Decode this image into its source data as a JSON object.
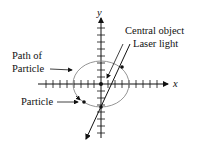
{
  "diagram": {
    "axis_x_label": "x",
    "axis_y_label": "y",
    "labels": {
      "central_object": "Central object",
      "laser_light": "Laser light",
      "path_line1": "Path of",
      "path_line2": "Particle",
      "particle": "Particle"
    },
    "colors": {
      "stroke": "#111111",
      "circle": "#888888"
    }
  }
}
